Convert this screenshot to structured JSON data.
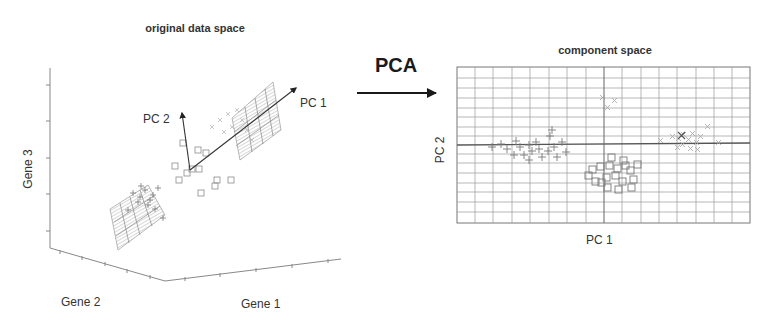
{
  "left_panel": {
    "title": "original data space",
    "axes": {
      "x": "Gene 1",
      "y": "Gene 2",
      "z": "Gene 3"
    },
    "vectors": [
      {
        "label": "PC 1"
      },
      {
        "label": "PC 2"
      }
    ],
    "groups": [
      "plus-markers",
      "square-markers",
      "cross-markers"
    ]
  },
  "transform": {
    "label": "PCA",
    "arrow": "right-arrow"
  },
  "right_panel": {
    "title": "component space",
    "xlabel": "PC 1",
    "ylabel": "PC 2",
    "grid": true
  },
  "colors": {
    "axis": "#777777",
    "grid": "#8a8a8a",
    "marker": "#8c8c8c",
    "arrow": "#222222",
    "plane": "#9a9a9a"
  }
}
